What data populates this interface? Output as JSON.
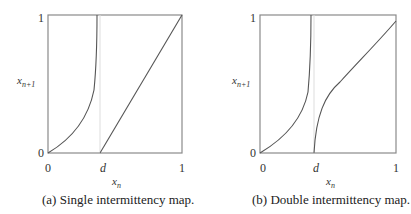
{
  "panels": [
    {
      "id": "a",
      "caption": "(a) Single intermittency map.",
      "xlabel": "x",
      "xlabel_sub": "n",
      "ylabel": "x",
      "ylabel_sub": "n+1",
      "x_ticks": [
        "0",
        "d",
        "1"
      ],
      "y_ticks": [
        "0",
        "1"
      ]
    },
    {
      "id": "b",
      "caption": "(b) Double intermittency map.",
      "xlabel": "x",
      "xlabel_sub": "n",
      "ylabel": "x",
      "ylabel_sub": "n+1",
      "x_ticks": [
        "0",
        "d",
        "1"
      ],
      "y_ticks": [
        "0",
        "1"
      ]
    }
  ],
  "colors": {
    "axis": "#808080",
    "curve": "#555555",
    "guide": "#cccccc"
  }
}
